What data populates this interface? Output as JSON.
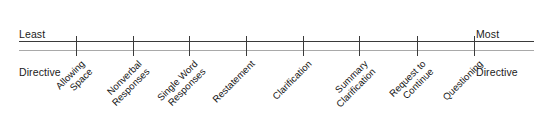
{
  "figure": {
    "type": "continuum-scale",
    "width": 546,
    "height": 131,
    "background_color": "#ffffff",
    "axis_color": "#3a3a3a",
    "axis_shadow_color": "#a9a9a9",
    "label_color": "#161616"
  },
  "endpoints": {
    "left": {
      "line1": "Least",
      "line2": "Directive"
    },
    "right": {
      "line1": "Most",
      "line2": "Directive"
    }
  },
  "chart_data": {
    "type": "scatter",
    "title": "",
    "xlabel": "",
    "ylabel": "",
    "axis_orientation": "horizontal",
    "grid": false,
    "legend": false,
    "axis_start_px": 19,
    "axis_end_px": 534,
    "left_anchor_label": "Least Directive",
    "right_anchor_label": "Most Directive",
    "categories": [
      "Allowing Space",
      "Nonverbal Responses",
      "Single Word Responses",
      "Restatement",
      "Clarification",
      "Summary Clarification",
      "Request to Continue",
      "Questioning"
    ],
    "x": [
      76,
      133,
      189,
      246,
      303,
      359,
      417,
      474
    ],
    "values": [
      1,
      2,
      3,
      4,
      5,
      6,
      7,
      8
    ]
  },
  "ticks": [
    {
      "index": 1,
      "x": 76,
      "name": "allowing-space",
      "line1": "Allowing",
      "line2": "Space"
    },
    {
      "index": 2,
      "x": 133,
      "name": "nonverbal-responses",
      "line1": "Nonverbal",
      "line2": "Responses"
    },
    {
      "index": 3,
      "x": 189,
      "name": "single-word-responses",
      "line1": "Single Word",
      "line2": "Responses"
    },
    {
      "index": 4,
      "x": 246,
      "name": "restatement",
      "line1": "Restatement",
      "line2": ""
    },
    {
      "index": 5,
      "x": 303,
      "name": "clarification",
      "line1": "Clarification",
      "line2": ""
    },
    {
      "index": 6,
      "x": 359,
      "name": "summary-clarification",
      "line1": "Summary",
      "line2": "Clarification"
    },
    {
      "index": 7,
      "x": 417,
      "name": "request-to-continue",
      "line1": "Request to",
      "line2": "Continue"
    },
    {
      "index": 8,
      "x": 474,
      "name": "questioning",
      "line1": "Questioning",
      "line2": ""
    }
  ]
}
